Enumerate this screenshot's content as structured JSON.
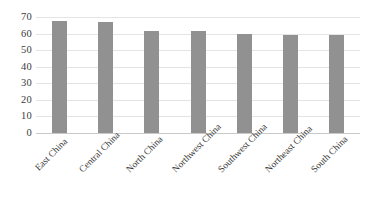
{
  "chart_data": {
    "type": "bar",
    "title": "",
    "xlabel": "",
    "ylabel": "",
    "categories": [
      "East China",
      "Central China",
      "North China",
      "Northwest China",
      "Southwest China",
      "Northeast China",
      "South China"
    ],
    "values": [
      67.5,
      67,
      61.5,
      61.5,
      60,
      59,
      59
    ],
    "ylim": [
      0,
      70
    ],
    "ytick_labels": [
      "70",
      "60",
      "50",
      "40",
      "30",
      "20",
      "10",
      "0"
    ],
    "ytick_values": [
      70,
      60,
      50,
      40,
      30,
      20,
      10,
      0
    ],
    "grid": "horizontal",
    "legend": "none",
    "bar_color": "#919191",
    "gridline_color": "#e4e4e4",
    "axis_color": "#c9c9c9",
    "text_color": "#3b3b3b",
    "background": "#ffffff",
    "xtick_rotation": -45
  }
}
